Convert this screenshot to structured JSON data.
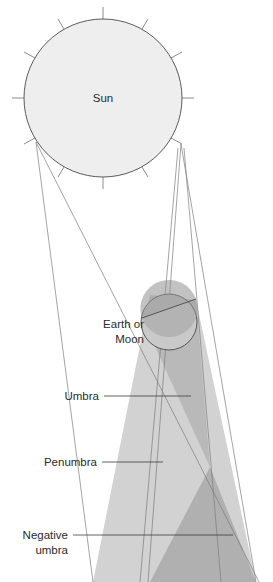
{
  "diagram": {
    "background_color": "#ffffff",
    "bodies": [
      {
        "id": "sun",
        "label": "Sun",
        "shape": "circle",
        "cx": 103,
        "cy": 98,
        "r": 79,
        "fill": "#eeeeee",
        "stroke": "#4a4a4a",
        "label_x": 103,
        "label_y": 102,
        "rays": 12,
        "ray_length": 12
      },
      {
        "id": "earth-moon",
        "label_line_1": "Earth or",
        "label_line_2": "Moon",
        "shape": "circle",
        "cx": 169,
        "cy": 322,
        "r": 28,
        "fill": "#c9c9c9",
        "stroke": "#4a4a4a",
        "label_x": 137,
        "label_y": 329,
        "label_y2": 345
      }
    ],
    "shadow_regions": [
      {
        "id": "penumbra",
        "label": "Penumbra",
        "fill": "#d2d2d2",
        "opacity": 1
      },
      {
        "id": "umbra",
        "label": "Umbra",
        "fill": "#b9b9b9",
        "opacity": 1
      },
      {
        "id": "negative-umbra",
        "label": "Negative umbra",
        "label_line_1": "Negative",
        "label_line_2": "umbra",
        "fill": "#b0b0b0",
        "opacity": 1
      }
    ],
    "callouts": [
      {
        "id": "earth-moon-callout",
        "line_1": "Earth or",
        "line_2": "Moon",
        "text_x": 144,
        "text_y": 328,
        "anchor": "end",
        "has_leader": false
      },
      {
        "id": "umbra-callout",
        "line_1": "Umbra",
        "text_x": 98,
        "text_y": 400,
        "anchor": "end",
        "has_leader": true,
        "leader_x1": 104,
        "leader_x2": 191,
        "leader_y": 396
      },
      {
        "id": "penumbra-callout",
        "line_1": "Penumbra",
        "text_x": 96,
        "text_y": 466,
        "anchor": "end",
        "has_leader": true,
        "leader_x1": 102,
        "leader_x2": 163,
        "leader_y": 462
      },
      {
        "id": "negative-umbra-callout",
        "line_1": "Negative",
        "line_2": "umbra",
        "text_x": 67,
        "text_y": 539,
        "anchor": "end",
        "has_leader": true,
        "leader_x1": 73,
        "leader_x2": 233,
        "leader_y": 535
      }
    ],
    "colors": {
      "sun_fill": "#eeeeee",
      "body_fill": "#c9c9c9",
      "penumbra_fill": "#d2d2d2",
      "umbra_fill": "#b9b9b9",
      "negative_umbra_fill": "#b0b0b0",
      "outline": "#4a4a4a",
      "ray_line": "#7d7d7d",
      "leader_line": "#3a3a3a",
      "text": "#2b2b2b"
    }
  }
}
